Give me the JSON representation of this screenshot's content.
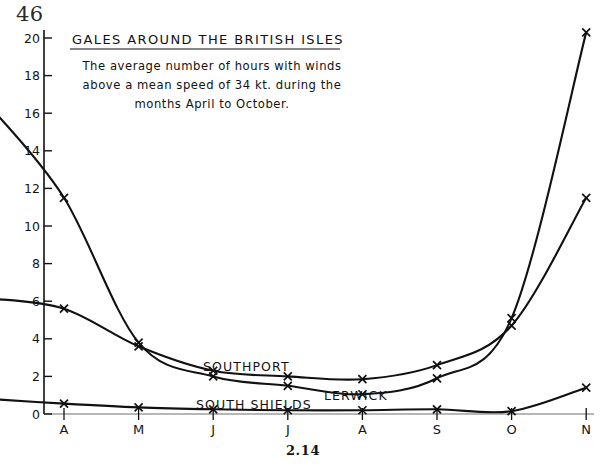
{
  "page": {
    "number": "46",
    "caption": "2.14"
  },
  "chart_data": {
    "type": "line",
    "title": "GALES   AROUND THE  BRITISH ISLES",
    "subtitle_lines": [
      "The average  number  of hours  with winds",
      "above a mean speed of  34 kt. during the",
      "months April to October."
    ],
    "xlabel": "",
    "ylabel": "",
    "categories": [
      "A",
      "M",
      "J",
      "J",
      "A",
      "S",
      "O",
      "N"
    ],
    "xlim": [
      0,
      8
    ],
    "ylim": [
      0,
      20
    ],
    "yticks": [
      0,
      2,
      4,
      6,
      8,
      10,
      12,
      14,
      16,
      18,
      20
    ],
    "ytick_labels": [
      "0",
      "2",
      "4",
      "6",
      "8",
      "10",
      "12",
      "14",
      "16",
      "18",
      "20"
    ],
    "grid": false,
    "legend": "inline-labels",
    "series": [
      {
        "name": "LERWICK",
        "label_position": "lower-right",
        "x": [
          0,
          1,
          2,
          3,
          4,
          5,
          6,
          7,
          8
        ],
        "values": [
          16.4,
          11.5,
          3.8,
          2.0,
          1.5,
          1.05,
          1.9,
          5.1,
          20.3
        ],
        "extends_beyond_top": true
      },
      {
        "name": "SOUTHPORT",
        "label_position": "mid-left",
        "x": [
          0,
          1,
          2,
          3,
          4,
          5,
          6,
          7,
          8
        ],
        "values": [
          6.15,
          5.6,
          3.6,
          2.3,
          2.0,
          1.85,
          2.6,
          4.7,
          9.5
        ],
        "value_at_n": 11.5
      },
      {
        "name": "SOUTH SHIELDS",
        "label_position": "bottom-left",
        "x": [
          0,
          1,
          2,
          3,
          4,
          5,
          6,
          7,
          8
        ],
        "values": [
          0.8,
          0.55,
          0.35,
          0.25,
          0.2,
          0.2,
          0.25,
          0.15,
          0.1
        ],
        "value_at_n": 1.4
      }
    ]
  }
}
